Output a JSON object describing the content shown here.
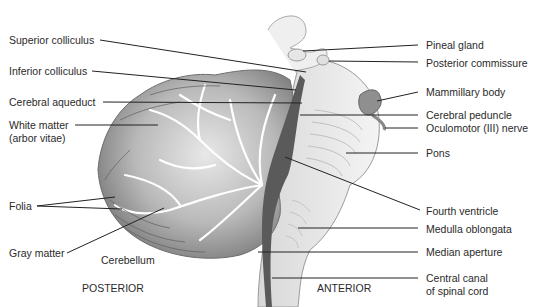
{
  "orientation": {
    "posterior": "POSTERIOR",
    "anterior": "ANTERIOR"
  },
  "structure_label": "Cerebellum",
  "left_labels": [
    {
      "id": "superior-colliculus",
      "text": "Superior colliculus"
    },
    {
      "id": "inferior-colliculus",
      "text": "Inferior colliculus"
    },
    {
      "id": "cerebral-aqueduct",
      "text": "Cerebral aqueduct"
    },
    {
      "id": "white-matter",
      "text": "White matter",
      "text2": "(arbor vitae)"
    },
    {
      "id": "folia",
      "text": "Folia"
    },
    {
      "id": "gray-matter",
      "text": "Gray matter"
    }
  ],
  "right_labels": [
    {
      "id": "pineal-gland",
      "text": "Pineal gland"
    },
    {
      "id": "posterior-commissure",
      "text": "Posterior commissure"
    },
    {
      "id": "mammillary-body",
      "text": "Mammillary body"
    },
    {
      "id": "cerebral-peduncle",
      "text": "Cerebral peduncle"
    },
    {
      "id": "oculomotor-nerve",
      "text": "Oculomotor (III) nerve"
    },
    {
      "id": "pons",
      "text": "Pons"
    },
    {
      "id": "fourth-ventricle",
      "text": "Fourth ventricle"
    },
    {
      "id": "medulla-oblongata",
      "text": "Medulla oblongata"
    },
    {
      "id": "median-aperture",
      "text": "Median aperture"
    },
    {
      "id": "central-canal",
      "text": "Central canal",
      "text2": "of spinal cord"
    }
  ]
}
